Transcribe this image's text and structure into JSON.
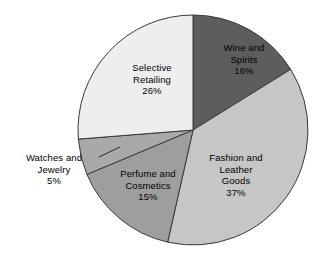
{
  "chart_data": {
    "type": "pie",
    "title": "",
    "subtitle": "",
    "xlabel": "",
    "ylabel": "",
    "legend_position": "none",
    "grid": false,
    "units": "percent",
    "total": 99,
    "categories": [
      "Wine and Spirits",
      "Fashion and Leather Goods",
      "Perfume and Cosmetics",
      "Watches and Jewelry",
      "Selective Retailing"
    ],
    "values": [
      16,
      37,
      15,
      5,
      26
    ],
    "slices": [
      {
        "label": "Wine and Spirits",
        "label_line1": "Wine and",
        "label_line2": "Spirits",
        "value": 16,
        "value_text": "16%",
        "color": "#5d5d5d",
        "label_inside": true,
        "label_x": 209,
        "label_y": 42,
        "label_width": 70
      },
      {
        "label": "Fashion and Leather Goods",
        "label_line1": "Fashion and",
        "label_line2": "Leather",
        "label_line3": "Goods",
        "value": 37,
        "value_text": "37%",
        "color": "#c6c6c6",
        "label_inside": true,
        "label_x": 196,
        "label_y": 152,
        "label_width": 80
      },
      {
        "label": "Perfume and Cosmetics",
        "label_line1": "Perfume and",
        "label_line2": "Cosmetics",
        "value": 15,
        "value_text": "15%",
        "color": "#9e9e9e",
        "label_inside": true,
        "label_x": 108,
        "label_y": 168,
        "label_width": 80
      },
      {
        "label": "Watches and Jewelry",
        "label_line1": "Watches and",
        "label_line2": "Jewelry",
        "value": 5,
        "value_text": "5%",
        "color": "#a9a9a9",
        "label_inside": false,
        "label_x": 11,
        "label_y": 152,
        "label_width": 86
      },
      {
        "label": "Selective Retailing",
        "label_line1": "Selective",
        "label_line2": "Retailing",
        "value": 26,
        "value_text": "26%",
        "color": "#eeeeee",
        "label_inside": true,
        "label_x": 116,
        "label_y": 62,
        "label_width": 72
      }
    ],
    "geometry": {
      "center_x": 193,
      "center_y": 130,
      "radius": 115,
      "start_angle_deg": 0,
      "direction": "clockwise"
    },
    "leader": {
      "from_x": 99,
      "from_y": 157,
      "to_x": 120,
      "to_y": 147
    },
    "colors": {
      "background": "#ffffff",
      "outline": "#3a3a3a",
      "text": "#000000"
    }
  }
}
